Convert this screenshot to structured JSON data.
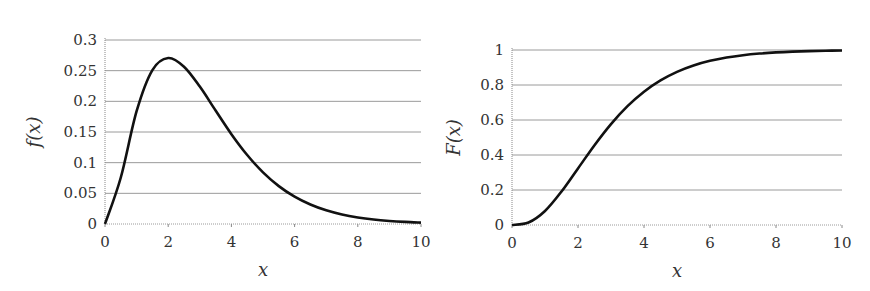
{
  "chart_data": [
    {
      "type": "line",
      "title": "",
      "xlabel": "x",
      "ylabel": "f(x)",
      "xlim": [
        0,
        10
      ],
      "ylim": [
        0,
        0.3
      ],
      "xticks": [
        "0",
        "2",
        "4",
        "6",
        "8",
        "10"
      ],
      "yticks": [
        "0",
        "0.05",
        "0.1",
        "0.15",
        "0.2",
        "0.25",
        "0.3"
      ],
      "grid": "horizontal",
      "series": [
        {
          "name": "pdf",
          "x": [
            0,
            0.5,
            1,
            1.5,
            2,
            2.5,
            3,
            3.5,
            4,
            4.5,
            5,
            5.5,
            6,
            6.5,
            7,
            7.5,
            8,
            8.5,
            9,
            9.5,
            10
          ],
          "values": [
            0,
            0.0758,
            0.1839,
            0.251,
            0.2707,
            0.2565,
            0.224,
            0.185,
            0.1465,
            0.1125,
            0.0842,
            0.0618,
            0.0446,
            0.0318,
            0.0223,
            0.0155,
            0.0107,
            0.0073,
            0.005,
            0.0034,
            0.0023
          ]
        }
      ]
    },
    {
      "type": "line",
      "title": "",
      "xlabel": "x",
      "ylabel": "F(x)",
      "xlim": [
        0,
        10
      ],
      "ylim": [
        0,
        1
      ],
      "xticks": [
        "0",
        "2",
        "4",
        "6",
        "8",
        "10"
      ],
      "yticks": [
        "0",
        "0.2",
        "0.4",
        "0.6",
        "0.8",
        "1"
      ],
      "grid": "horizontal",
      "series": [
        {
          "name": "cdf",
          "x": [
            0,
            0.5,
            1,
            1.5,
            2,
            2.5,
            3,
            3.5,
            4,
            4.5,
            5,
            5.5,
            6,
            6.5,
            7,
            7.5,
            8,
            8.5,
            9,
            9.5,
            10
          ],
          "values": [
            0,
            0.0144,
            0.0803,
            0.1912,
            0.3233,
            0.4562,
            0.5768,
            0.6792,
            0.7619,
            0.8264,
            0.8753,
            0.9116,
            0.938,
            0.957,
            0.9704,
            0.9797,
            0.9862,
            0.9907,
            0.9938,
            0.9958,
            0.9972
          ]
        }
      ]
    }
  ],
  "plots": {
    "left": {
      "ylabel": "f(x)",
      "xlabel": "x"
    },
    "right": {
      "ylabel": "F(x)",
      "xlabel": "x"
    }
  },
  "colors": {
    "curve": "#111111",
    "grid": "#9a9a9a",
    "axis": "#888888",
    "text": "#333333"
  }
}
